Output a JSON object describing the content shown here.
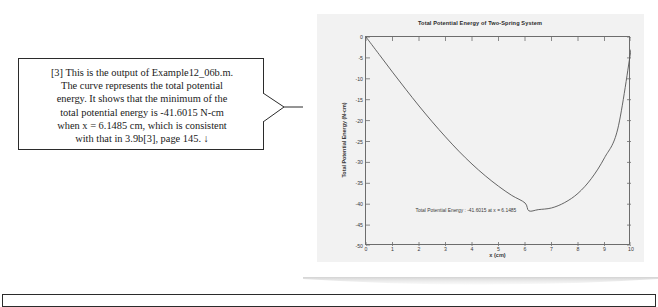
{
  "callout": {
    "text": "[3] This is the output of Example12_06b.m.\nThe curve represents the total potential\nenergy.  It shows that the minimum of the\ntotal potential energy is -41.6015 N-cm\nwhen x = 6.1485 cm,  which is consistent\nwith that in 3.9b[3], page 145.  ↓"
  },
  "figure": {
    "annotation": "Total Potential Energy : -41.6015 at x = 6.1485"
  },
  "chart_data": {
    "type": "line",
    "title": "Total Potential Energy of Two-Spring System",
    "xlabel": "x (cm)",
    "ylabel": "Total Potential Energy (N-cm)",
    "xlim": [
      0,
      10
    ],
    "ylim": [
      -50,
      0
    ],
    "xticks": [
      0,
      1,
      2,
      3,
      4,
      5,
      6,
      7,
      8,
      9,
      10
    ],
    "xtick_labels": [
      "0",
      "1",
      "2",
      "3",
      "4",
      "5",
      "6",
      "7",
      "8",
      "9",
      "10"
    ],
    "yticks": [
      0,
      -5,
      -10,
      -15,
      -20,
      -25,
      -30,
      -35,
      -40,
      -45,
      -50
    ],
    "ytick_labels": [
      "0",
      "-5",
      "-10",
      "-15",
      "-20",
      "-25",
      "-30",
      "-35",
      "-40",
      "-45",
      "-50"
    ],
    "grid": false,
    "legend": "none",
    "line_color": "#555555",
    "minimum": {
      "x": 6.1485,
      "y": -41.6015
    },
    "annotation": "Total Potential Energy : -41.6015 at x = 6.1485",
    "series": [
      {
        "name": "Total Potential Energy",
        "x": [
          0,
          0.5,
          1,
          1.5,
          2,
          2.5,
          3,
          3.5,
          4,
          4.5,
          5,
          5.5,
          6,
          6.1485,
          6.5,
          7,
          7.5,
          8,
          8.5,
          9,
          9.5,
          10
        ],
        "y": [
          0,
          -4.2,
          -8.4,
          -12.5,
          -16.5,
          -20.3,
          -23.9,
          -27.3,
          -30.4,
          -33.2,
          -35.7,
          -37.9,
          -39.7,
          -41.6,
          -41.3,
          -40.9,
          -39.6,
          -37.4,
          -33.9,
          -28.9,
          -22.0,
          -3.0
        ]
      }
    ]
  }
}
